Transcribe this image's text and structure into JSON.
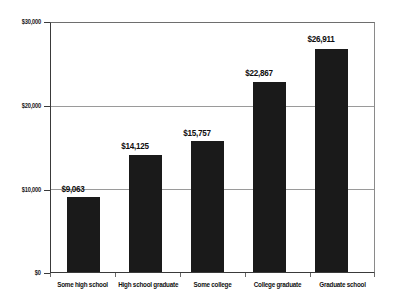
{
  "chart_data": {
    "type": "bar",
    "title": "",
    "subtitle": "",
    "xlabel": "",
    "ylabel": "",
    "categories": [
      "Some high school",
      "High school graduate",
      "Some college",
      "College graduate",
      "Graduate school"
    ],
    "values": [
      9063,
      14125,
      15757,
      22867,
      26911
    ],
    "data_labels": [
      "$9,063",
      "$14,125",
      "$15,757",
      "$22,867",
      "$26,911"
    ],
    "ylim": [
      0,
      30000
    ],
    "yticks": [
      0,
      10000,
      20000,
      30000
    ],
    "ytick_labels": [
      "$0",
      "$10,000",
      "$20,000",
      "$30,000"
    ],
    "grid": true,
    "grid_axis": "y",
    "legend": false,
    "bar_color": "#1a1a1a",
    "grid_color": "#9a9a9a",
    "axis_color": "#3a3a3a",
    "background_color": "#ffffff"
  }
}
